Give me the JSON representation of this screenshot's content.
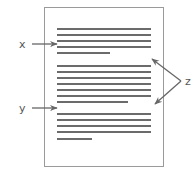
{
  "diagram": {
    "type": "document-layout-annotation",
    "page": {
      "border_color": "#999999",
      "background": "#ffffff"
    },
    "text_line_color": "#3a3a3a",
    "arrow_color": "#666666",
    "paragraphs": [
      {
        "lines": 5,
        "last_line_short": true
      },
      {
        "lines": 7,
        "last_line_short": true
      },
      {
        "lines": 5,
        "last_line_short": true
      }
    ],
    "labels": {
      "x": "x",
      "y": "y",
      "z": "z"
    },
    "annotations": [
      {
        "label": "x",
        "points_to": "line within first paragraph"
      },
      {
        "label": "y",
        "points_to": "gap between second and third paragraph"
      },
      {
        "label": "z",
        "points_to": [
          "right margin above second paragraph",
          "right margin below second paragraph"
        ]
      }
    ]
  }
}
